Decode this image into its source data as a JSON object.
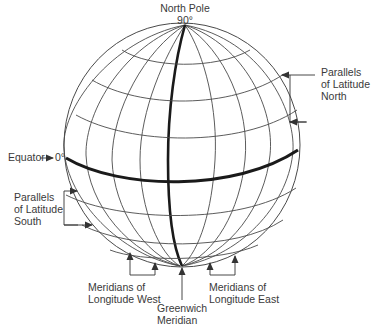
{
  "labels": {
    "north_pole": "North Pole",
    "north_pole_degrees": "90°",
    "parallels_north_line1": "Parallels",
    "parallels_north_line2": "of Latitude",
    "parallels_north_line3": "North",
    "equator": "Equator",
    "equator_degrees": "0°",
    "parallels_south_line1": "Parallels",
    "parallels_south_line2": "of Latitude",
    "parallels_south_line3": "South",
    "meridians_west_line1": "Meridians of",
    "meridians_west_line2": "Longitude West",
    "meridians_east_line1": "Meridians of",
    "meridians_east_line2": "Longitude East",
    "greenwich_line1": "Greenwich",
    "greenwich_line2": "Meridian"
  },
  "colors": {
    "line": "#4a4a4a",
    "bold_line": "#1a1a1a",
    "text": "#3a3a3a",
    "background": "#ffffff"
  }
}
